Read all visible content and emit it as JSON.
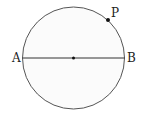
{
  "diagram": {
    "type": "circle-with-diameter",
    "circle": {
      "cx": 73.5,
      "cy": 58,
      "r": 51,
      "stroke": "#555555",
      "fill": "#fbfbfb"
    },
    "diameter": {
      "from": "A",
      "to": "B",
      "stroke": "#333333"
    },
    "center_point": {
      "x": 73.5,
      "y": 58
    },
    "labels": {
      "A": "A",
      "B": "B",
      "P": "P"
    },
    "point_P": {
      "x": 108,
      "y": 20
    }
  }
}
